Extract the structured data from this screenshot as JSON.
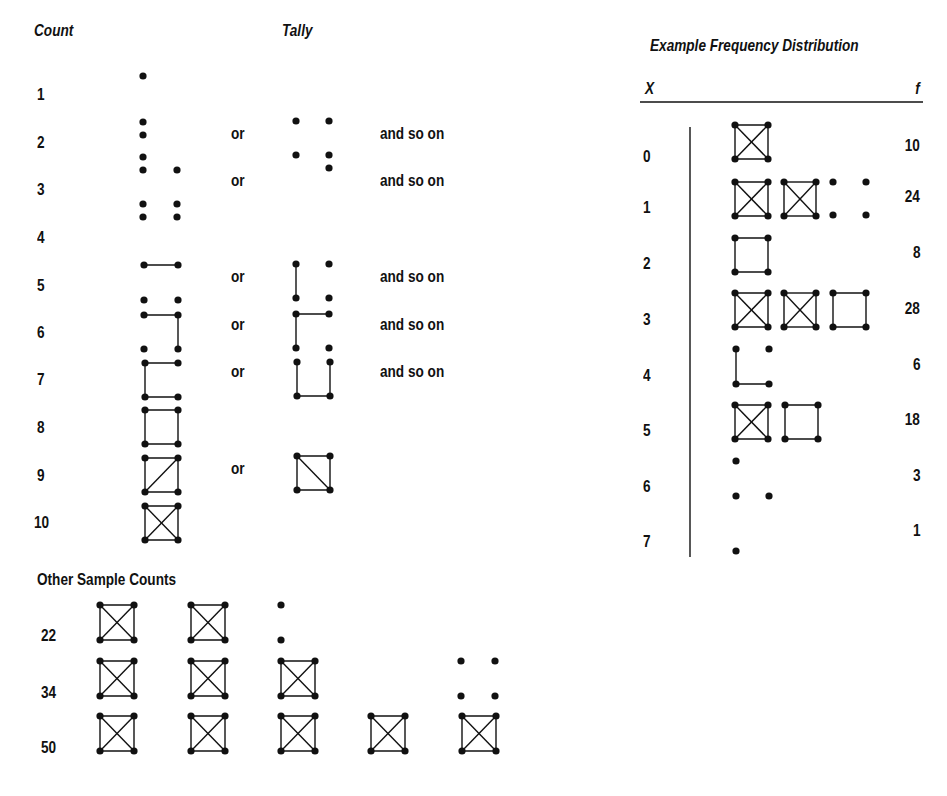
{
  "left": {
    "headers": {
      "count": "Count",
      "tally": "Tally"
    },
    "or_label": "or",
    "and_so_on_label": "and so on",
    "rows": [
      {
        "count": "1",
        "label_y": 86
      },
      {
        "count": "2",
        "label_y": 134
      },
      {
        "count": "3",
        "label_y": 181
      },
      {
        "count": "4",
        "label_y": 229
      },
      {
        "count": "5",
        "label_y": 277
      },
      {
        "count": "6",
        "label_y": 324
      },
      {
        "count": "7",
        "label_y": 371
      },
      {
        "count": "8",
        "label_y": 419
      },
      {
        "count": "9",
        "label_y": 467
      },
      {
        "count": "10",
        "label_y": 514
      }
    ],
    "or_rows_y": [
      125,
      172,
      268,
      316,
      363,
      460
    ],
    "and_so_on_rows_y": [
      125,
      172,
      268,
      316,
      363
    ]
  },
  "other_samples": {
    "title": "Other Sample Counts",
    "rows": [
      {
        "count": "22",
        "full_boxes": 2,
        "remainder": 2,
        "label_y": 627
      },
      {
        "count": "34",
        "full_boxes": 3,
        "remainder": 4,
        "label_y": 684
      },
      {
        "count": "50",
        "full_boxes": 5,
        "remainder": 0,
        "label_y": 739
      }
    ]
  },
  "frequency_distribution": {
    "title": "Example Frequency Distribution",
    "x_header": "X",
    "f_header": "f",
    "rows": [
      {
        "x": "0",
        "f": "10"
      },
      {
        "x": "1",
        "f": "24"
      },
      {
        "x": "2",
        "f": "8"
      },
      {
        "x": "3",
        "f": "28"
      },
      {
        "x": "4",
        "f": "6"
      },
      {
        "x": "5",
        "f": "18"
      },
      {
        "x": "6",
        "f": "3"
      },
      {
        "x": "7",
        "f": "1"
      }
    ]
  },
  "colors": {
    "ink": "#111111",
    "background": "#ffffff"
  }
}
